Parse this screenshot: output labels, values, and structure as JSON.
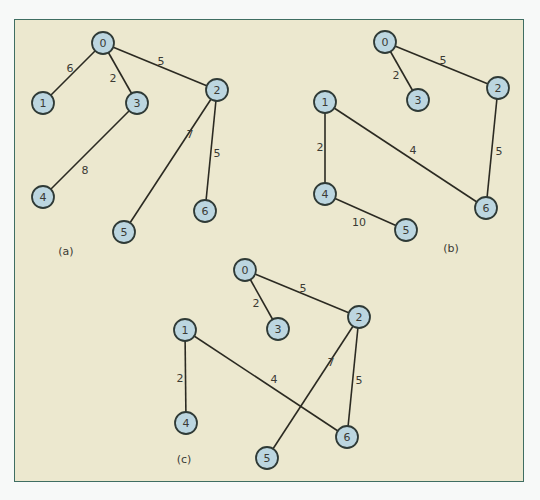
{
  "figure": {
    "panel_colors": {
      "background": "#ece8cf",
      "border": "#3f6e62",
      "node_fill": "#bcd6e0",
      "node_stroke": "#2f3a36",
      "edge": "#2b2a22"
    },
    "node_radius": 11,
    "graphs": [
      {
        "id": "a",
        "caption": "(a)",
        "caption_pos": [
          66,
          251
        ],
        "nodes": [
          {
            "label": "0",
            "x": 103,
            "y": 43
          },
          {
            "label": "1",
            "x": 43,
            "y": 103
          },
          {
            "label": "2",
            "x": 217,
            "y": 90
          },
          {
            "label": "3",
            "x": 137,
            "y": 103
          },
          {
            "label": "4",
            "x": 43,
            "y": 197
          },
          {
            "label": "5",
            "x": 124,
            "y": 232
          },
          {
            "label": "6",
            "x": 205,
            "y": 211
          }
        ],
        "edges": [
          {
            "from": "0",
            "to": "1",
            "weight": "6",
            "label_pos": [
              70,
              68
            ]
          },
          {
            "from": "0",
            "to": "3",
            "weight": "2",
            "label_pos": [
              113,
              78
            ]
          },
          {
            "from": "0",
            "to": "2",
            "weight": "5",
            "label_pos": [
              161,
              61
            ]
          },
          {
            "from": "3",
            "to": "4",
            "weight": "8",
            "label_pos": [
              85,
              170
            ]
          },
          {
            "from": "2",
            "to": "5",
            "weight": "7",
            "label_pos": [
              190,
              134
            ]
          },
          {
            "from": "2",
            "to": "6",
            "weight": "5",
            "label_pos": [
              217,
              153
            ]
          }
        ]
      },
      {
        "id": "b",
        "caption": "(b)",
        "caption_pos": [
          451,
          248
        ],
        "nodes": [
          {
            "label": "0",
            "x": 385,
            "y": 42
          },
          {
            "label": "1",
            "x": 325,
            "y": 102
          },
          {
            "label": "2",
            "x": 498,
            "y": 88
          },
          {
            "label": "3",
            "x": 418,
            "y": 100
          },
          {
            "label": "4",
            "x": 325,
            "y": 194
          },
          {
            "label": "5",
            "x": 406,
            "y": 230
          },
          {
            "label": "6",
            "x": 486,
            "y": 208
          }
        ],
        "edges": [
          {
            "from": "0",
            "to": "3",
            "weight": "2",
            "label_pos": [
              396,
              75
            ]
          },
          {
            "from": "0",
            "to": "2",
            "weight": "5",
            "label_pos": [
              443,
              60
            ]
          },
          {
            "from": "1",
            "to": "4",
            "weight": "2",
            "label_pos": [
              320,
              147
            ]
          },
          {
            "from": "1",
            "to": "6",
            "weight": "4",
            "label_pos": [
              413,
              150
            ]
          },
          {
            "from": "2",
            "to": "6",
            "weight": "5",
            "label_pos": [
              499,
              151
            ]
          },
          {
            "from": "4",
            "to": "5",
            "weight": "10",
            "label_pos": [
              359,
              222
            ]
          }
        ]
      },
      {
        "id": "c",
        "caption": "(c)",
        "caption_pos": [
          184,
          459
        ],
        "nodes": [
          {
            "label": "0",
            "x": 245,
            "y": 270
          },
          {
            "label": "1",
            "x": 185,
            "y": 330
          },
          {
            "label": "2",
            "x": 359,
            "y": 317
          },
          {
            "label": "3",
            "x": 278,
            "y": 329
          },
          {
            "label": "4",
            "x": 186,
            "y": 423
          },
          {
            "label": "5",
            "x": 267,
            "y": 458
          },
          {
            "label": "6",
            "x": 347,
            "y": 437
          }
        ],
        "edges": [
          {
            "from": "0",
            "to": "3",
            "weight": "2",
            "label_pos": [
              256,
              303
            ]
          },
          {
            "from": "0",
            "to": "2",
            "weight": "5",
            "label_pos": [
              303,
              288
            ]
          },
          {
            "from": "1",
            "to": "4",
            "weight": "2",
            "label_pos": [
              180,
              378
            ]
          },
          {
            "from": "1",
            "to": "6",
            "weight": "4",
            "label_pos": [
              274,
              379
            ]
          },
          {
            "from": "2",
            "to": "5",
            "weight": "7",
            "label_pos": [
              331,
              362
            ]
          },
          {
            "from": "2",
            "to": "6",
            "weight": "5",
            "label_pos": [
              359,
              380
            ]
          }
        ]
      }
    ]
  }
}
